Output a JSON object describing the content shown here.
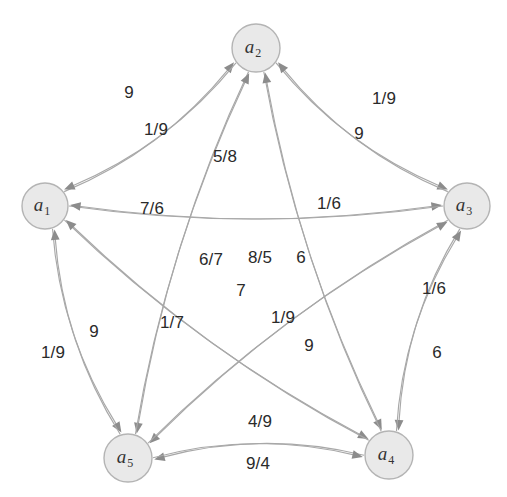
{
  "figure": {
    "type": "directed-graph",
    "width": 507,
    "height": 497,
    "background_color": "#ffffff",
    "node_fill_color": "#e9e9e9",
    "node_stroke_color": "#b4b4b4",
    "edge_color": "#a8a8a8",
    "arrow_color": "#8c8c8c",
    "label_color": "#2a2a2a"
  },
  "nodes": [
    {
      "id": "a1",
      "label": "a",
      "sub": "1",
      "cx": 45,
      "cy": 206,
      "r": 23
    },
    {
      "id": "a2",
      "label": "a",
      "sub": "2",
      "cx": 256,
      "cy": 48,
      "r": 24
    },
    {
      "id": "a3",
      "label": "a",
      "sub": "3",
      "cx": 467,
      "cy": 206,
      "r": 23
    },
    {
      "id": "a4",
      "label": "a",
      "sub": "4",
      "cx": 389,
      "cy": 455,
      "r": 24
    },
    {
      "id": "a5",
      "label": "a",
      "sub": "5",
      "cx": 128,
      "cy": 458,
      "r": 24
    }
  ],
  "edges": [
    {
      "from": "a1",
      "to": "a2",
      "label": "9",
      "lx": 129,
      "ly": 92
    },
    {
      "from": "a2",
      "to": "a1",
      "label": "1/9",
      "lx": 156,
      "ly": 129
    },
    {
      "from": "a1",
      "to": "a3",
      "label": "5/8",
      "lx": 225,
      "ly": 156
    },
    {
      "from": "a3",
      "to": "a1",
      "label": "8/5",
      "lx": 260,
      "ly": 257
    },
    {
      "from": "a2",
      "to": "a3",
      "label": "1/9",
      "lx": 384,
      "ly": 98
    },
    {
      "from": "a3",
      "to": "a2",
      "label": "9",
      "lx": 359,
      "ly": 133
    },
    {
      "from": "a1",
      "to": "a4",
      "label": "7/6",
      "lx": 152,
      "ly": 208
    },
    {
      "from": "a4",
      "to": "a1",
      "label": "6/7",
      "lx": 211,
      "ly": 259
    },
    {
      "from": "a2",
      "to": "a4",
      "label": "1/6",
      "lx": 329,
      "ly": 203
    },
    {
      "from": "a4",
      "to": "a2",
      "label": "6",
      "lx": 301,
      "ly": 257
    },
    {
      "from": "a1",
      "to": "a5",
      "label": "1/9",
      "lx": 53,
      "ly": 352
    },
    {
      "from": "a5",
      "to": "a1",
      "label": "9",
      "lx": 94,
      "ly": 331
    },
    {
      "from": "a2",
      "to": "a5",
      "label": "7",
      "lx": 241,
      "ly": 290
    },
    {
      "from": "a5",
      "to": "a2",
      "label": "1/7",
      "lx": 172,
      "ly": 322
    },
    {
      "from": "a3",
      "to": "a5",
      "label": "1/9",
      "lx": 283,
      "ly": 317
    },
    {
      "from": "a5",
      "to": "a3",
      "label": "9",
      "lx": 309,
      "ly": 345
    },
    {
      "from": "a3",
      "to": "a4",
      "label": "1/6",
      "lx": 434,
      "ly": 288
    },
    {
      "from": "a4",
      "to": "a3",
      "label": "6",
      "lx": 437,
      "ly": 352
    },
    {
      "from": "a4",
      "to": "a5",
      "label": "4/9",
      "lx": 260,
      "ly": 421
    },
    {
      "from": "a5",
      "to": "a4",
      "label": "9/4",
      "lx": 258,
      "ly": 463
    }
  ]
}
